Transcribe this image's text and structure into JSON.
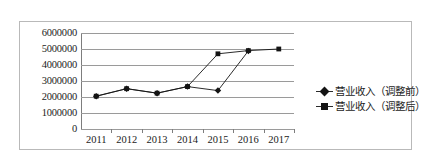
{
  "chart_data": {
    "type": "line",
    "title": "",
    "xlabel": "",
    "ylabel": "",
    "categories": [
      "2011",
      "2012",
      "2013",
      "2014",
      "2015",
      "2016",
      "2017"
    ],
    "series": [
      {
        "name": "营业收入（调整前）",
        "marker": "diamond",
        "color": "#141414",
        "values": [
          2050000,
          2520000,
          2240000,
          2650000,
          2400000,
          4880000,
          null
        ]
      },
      {
        "name": "营业收入（调整后）",
        "marker": "square",
        "color": "#141414",
        "values": [
          2050000,
          2520000,
          2240000,
          2650000,
          4700000,
          4900000,
          5000000
        ]
      }
    ],
    "ylim": [
      0,
      6000000
    ],
    "y_ticks": [
      "0",
      "1000000",
      "2000000",
      "3000000",
      "4000000",
      "5000000",
      "6000000"
    ],
    "y_tick_values": [
      0,
      1000000,
      2000000,
      3000000,
      4000000,
      5000000,
      6000000
    ],
    "grid": true,
    "grid_axis": "y",
    "legend_position": "right"
  },
  "legend": {
    "items": [
      {
        "label": "营业收入（调整前）",
        "marker": "diamond"
      },
      {
        "label": "营业收入（调整后）",
        "marker": "square"
      }
    ]
  }
}
